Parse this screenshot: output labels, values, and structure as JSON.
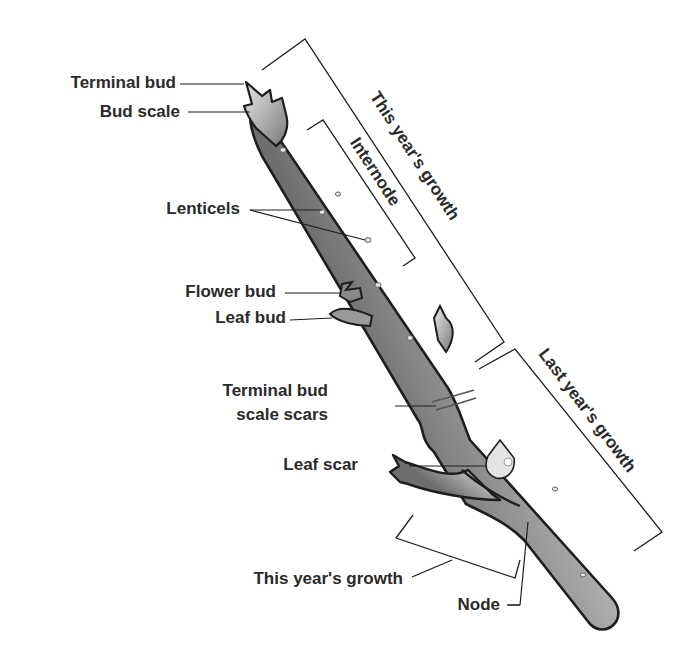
{
  "labels": {
    "terminal_bud": "Terminal bud",
    "bud_scale": "Bud scale",
    "lenticels": "Lenticels",
    "flower_bud": "Flower bud",
    "leaf_bud": "Leaf bud",
    "terminal_bud_scale_scars_line1": "Terminal bud",
    "terminal_bud_scale_scars_line2": "scale scars",
    "leaf_scar": "Leaf scar",
    "this_years_growth_branch": "This year's growth",
    "node": "Node"
  },
  "brackets": {
    "this_years_growth": "This year's growth",
    "internode": "Internode",
    "last_years_growth": "Last year's growth"
  },
  "colors": {
    "stroke": "#1e1e1e",
    "stem_light": "#d8d8d8",
    "stem_mid": "#9a9a9a",
    "stem_dark": "#5a5a5a",
    "text": "#2a2a2a"
  }
}
